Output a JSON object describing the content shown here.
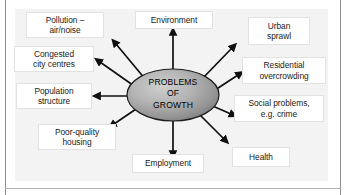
{
  "diagram": {
    "title": "Problems of Growth",
    "core": {
      "name": "problems-of-growth-core",
      "lines": [
        "PROBLEMS",
        "OF",
        "GROWTH"
      ],
      "fill_center": "#bcbcbc",
      "fill_edge": "#7f7f7f",
      "stroke": "#1c1c1c"
    },
    "arrow_color": "#101010",
    "panel_background": "#f3f3f3",
    "frame_color": "#8d8d8d",
    "node_background": "#ffffff",
    "node_border": "#e2e2e2",
    "nodes": [
      {
        "id": "pollution",
        "label": "Pollution –\nair/noise",
        "direction": "up-left"
      },
      {
        "id": "congested",
        "label": "Congested\ncity centres",
        "direction": "left-up"
      },
      {
        "id": "population",
        "label": "Population\nstructure",
        "direction": "left"
      },
      {
        "id": "poorquality",
        "label": "Poor-quality\nhousing",
        "direction": "down-left"
      },
      {
        "id": "environment",
        "label": "Environment",
        "direction": "up"
      },
      {
        "id": "employment",
        "label": "Employment",
        "direction": "down"
      },
      {
        "id": "urban",
        "label": "Urban\nsprawl",
        "direction": "up-right"
      },
      {
        "id": "residential",
        "label": "Residential\novercrowding",
        "direction": "right"
      },
      {
        "id": "social",
        "label": "Social problems,\ne.g. crime",
        "direction": "down-right"
      },
      {
        "id": "health",
        "label": "Health",
        "direction": "down-right-far"
      }
    ]
  }
}
